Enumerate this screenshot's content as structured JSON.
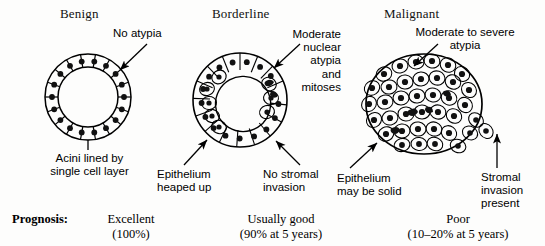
{
  "columns": [
    {
      "key": "benign",
      "heading": "Benign",
      "annotations": [
        {
          "name": "no-atypia",
          "text": "No atypia"
        },
        {
          "name": "acini-lining",
          "text": "Acini lined by\nsingle cell layer"
        }
      ],
      "prognosis": "Excellent\n(100%)"
    },
    {
      "key": "borderline",
      "heading": "Borderline",
      "annotations": [
        {
          "name": "nuclear-atypia-mitoses",
          "text": "Moderate\nnuclear\natypia\nand\nmitoses"
        },
        {
          "name": "epithelium-heaped-up",
          "text": "Epithelium\nheaped up"
        },
        {
          "name": "no-stromal-invasion",
          "text": "No stromal\ninvasion"
        }
      ],
      "prognosis": "Usually good\n(90% at 5 years)"
    },
    {
      "key": "malignant",
      "heading": "Malignant",
      "annotations": [
        {
          "name": "moderate-severe-atypia",
          "text": "Moderate to severe\natypia"
        },
        {
          "name": "epithelium-may-be-solid",
          "text": "Epithelium\nmay be solid"
        },
        {
          "name": "stromal-invasion-present",
          "text": "Stromal\ninvasion\npresent"
        }
      ],
      "prognosis": "Poor\n(10–20% at 5 years)"
    }
  ],
  "prognosis_row": {
    "label": "Prognosis:"
  },
  "colors": {
    "ink": "#000000",
    "nucleus": "#111111",
    "background": "#fdfdfc"
  }
}
